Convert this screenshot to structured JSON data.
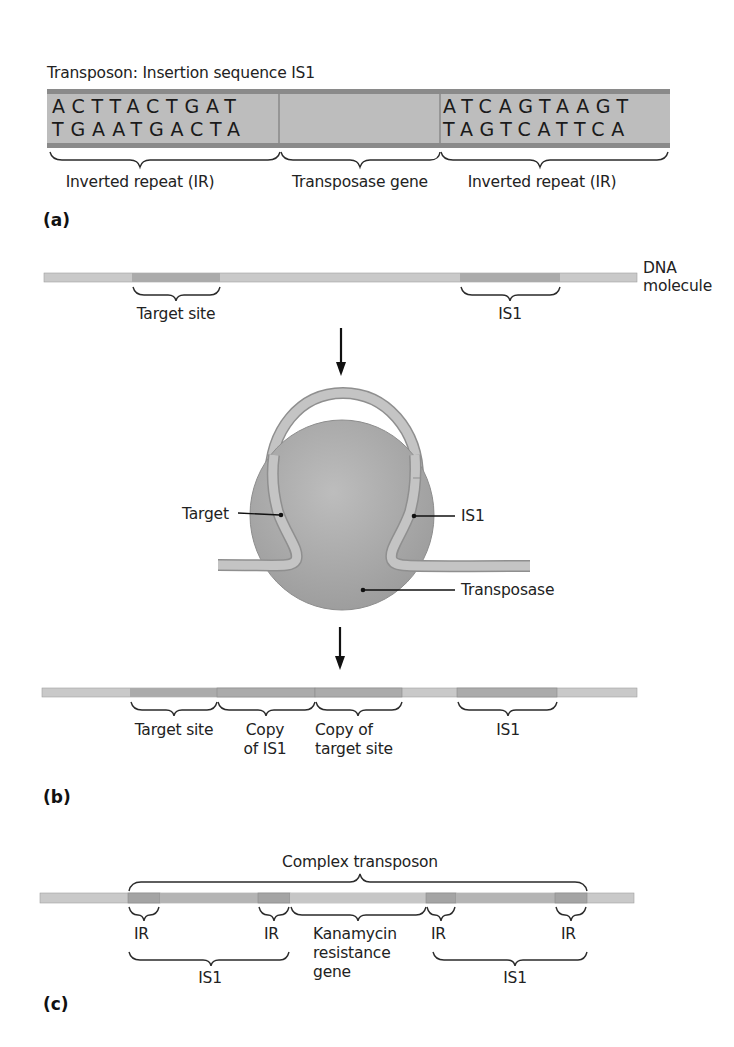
{
  "panel_a": {
    "label": "(a)",
    "title": "Transposon: Insertion sequence IS1",
    "left_ir": {
      "top": "ACTTACTGAT",
      "bottom": "TGAATGACTA"
    },
    "right_ir": {
      "top": "ATCAGTAAGT",
      "bottom": "TAGTCATTCA"
    },
    "brackets": [
      {
        "label": "Inverted repeat (IR)"
      },
      {
        "label": "Transposase gene"
      },
      {
        "label": "Inverted repeat (IR)"
      }
    ]
  },
  "panel_b": {
    "label": "(b)",
    "dna_label_line1": "DNA",
    "dna_label_line2": "molecule",
    "top_labels": {
      "target_site": "Target site",
      "is1": "IS1"
    },
    "complex_labels": {
      "target": "Target",
      "is1": "IS1",
      "transposase": "Transposase"
    },
    "bottom_labels": {
      "target_site": "Target site",
      "copy_is1_line1": "Copy",
      "copy_is1_line2": "of IS1",
      "copy_target_line1": "Copy of",
      "copy_target_line2": "target site",
      "is1": "IS1"
    }
  },
  "panel_c": {
    "label": "(c)",
    "title": "Complex transposon",
    "ir_labels": [
      "IR",
      "IR",
      "IR",
      "IR"
    ],
    "kanamycin_line1": "Kanamycin",
    "kanamycin_line2": "resistance",
    "kanamycin_line3": "gene",
    "is1_left": "IS1",
    "is1_right": "IS1"
  },
  "colors": {
    "dna_light": "#c9c9c9",
    "dna_dark": "#a9a9a9",
    "dna_edge": "#9a9a9a",
    "box_fill": "#bdbdbd",
    "box_border": "#8a8a8a",
    "protein": "#a6a6a6",
    "ink": "#1e1e1e"
  }
}
